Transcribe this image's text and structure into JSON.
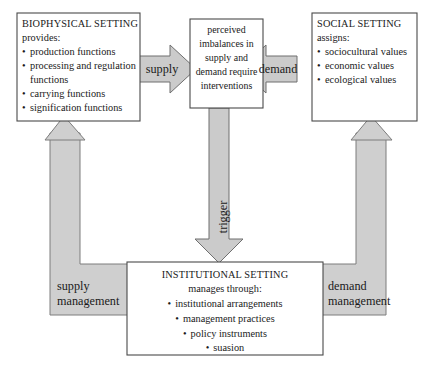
{
  "figure": {
    "type": "flow-diagram",
    "title_visible": false
  },
  "nodes": {
    "biophysical": {
      "heading": "BIOPHYSICAL SETTING",
      "subheading": "provides:",
      "bullets": [
        "production functions",
        "processing and regulation",
        "functions",
        "carrying functions",
        "signification functions"
      ]
    },
    "perceived": {
      "lines": [
        "perceived",
        "imbalances in",
        "supply and",
        "demand require",
        "interventions"
      ]
    },
    "social": {
      "heading": "SOCIAL SETTING",
      "subheading": "assigns:",
      "bullets": [
        "sociocultural values",
        "economic values",
        "ecological values"
      ]
    },
    "institutional": {
      "heading": "INSTITUTIONAL SETTING",
      "subheading": "manages through:",
      "bullets": [
        "institutional arrangements",
        "management practices",
        "policy instruments",
        "suasion"
      ]
    }
  },
  "connectors": {
    "supply_arrow": "supply",
    "demand_arrow": "demand",
    "trigger_arrow": "trigger",
    "supply_management": {
      "line1": "supply",
      "line2": "management"
    },
    "demand_management": {
      "line1": "demand",
      "line2": "management"
    }
  },
  "bullet_glyph": "•",
  "colors": {
    "box_fill": "#ffffff",
    "box_stroke": "#4a4a4a",
    "band_fill": "#cfcfcf",
    "band_stroke": "#7d7d7d",
    "arrow_fill": "#cbcbcb",
    "arrow_stroke": "#6f6f6f",
    "text": "#1a1a1a",
    "page_background": "#ffffff"
  }
}
